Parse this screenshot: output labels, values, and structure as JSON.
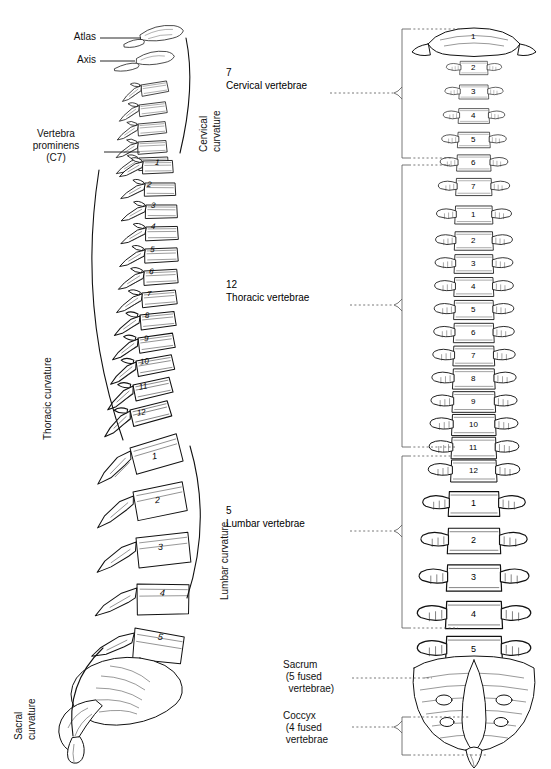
{
  "figure": {
    "background": "#ffffff",
    "ink": "#000000"
  },
  "left_view": {
    "name": "lateral-view",
    "callouts": [
      {
        "id": "atlas",
        "text": "Atlas",
        "leader": "line"
      },
      {
        "id": "axis",
        "text": "Axis",
        "leader": "line"
      },
      {
        "id": "vertebra-prominens",
        "text": "Vertebra\nprominens\n(C7)",
        "leader": "line"
      }
    ],
    "curvatures": [
      {
        "id": "cervical-curvature",
        "line1": "Cervical",
        "line2": "curvature"
      },
      {
        "id": "thoracic-curvature",
        "line1": "Thoracic curvature",
        "line2": ""
      },
      {
        "id": "lumbar-curvature",
        "line1": "Lumbar curvature",
        "line2": ""
      },
      {
        "id": "sacral-curvature",
        "line1": "Sacral",
        "line2": "curvature"
      }
    ],
    "thoracic_numbers": [
      "1",
      "2",
      "3",
      "4",
      "5",
      "6",
      "7",
      "8",
      "9",
      "10",
      "11",
      "12"
    ],
    "lumbar_numbers": [
      "1",
      "2",
      "3",
      "4",
      "5"
    ]
  },
  "right_view": {
    "name": "posterior-view",
    "groups": [
      {
        "id": "cervical",
        "count": "7",
        "label": "Cervical vertebrae"
      },
      {
        "id": "thoracic",
        "count": "12",
        "label": "Thoracic vertebrae"
      },
      {
        "id": "lumbar",
        "count": "5",
        "label": "Lumbar vertebrae"
      },
      {
        "id": "sacrum",
        "count": "",
        "label": "Sacrum\n (5 fused\n  vertebrae)"
      },
      {
        "id": "coccyx",
        "count": "",
        "label": "Coccyx\n (4 fused\n vertebrae"
      }
    ],
    "cervical_numbers": [
      "1",
      "2",
      "3",
      "4",
      "5",
      "6",
      "7"
    ],
    "thoracic_numbers": [
      "1",
      "2",
      "3",
      "4",
      "5",
      "6",
      "7",
      "8",
      "9",
      "10",
      "11",
      "12"
    ],
    "lumbar_numbers": [
      "1",
      "2",
      "3",
      "4",
      "5"
    ]
  }
}
